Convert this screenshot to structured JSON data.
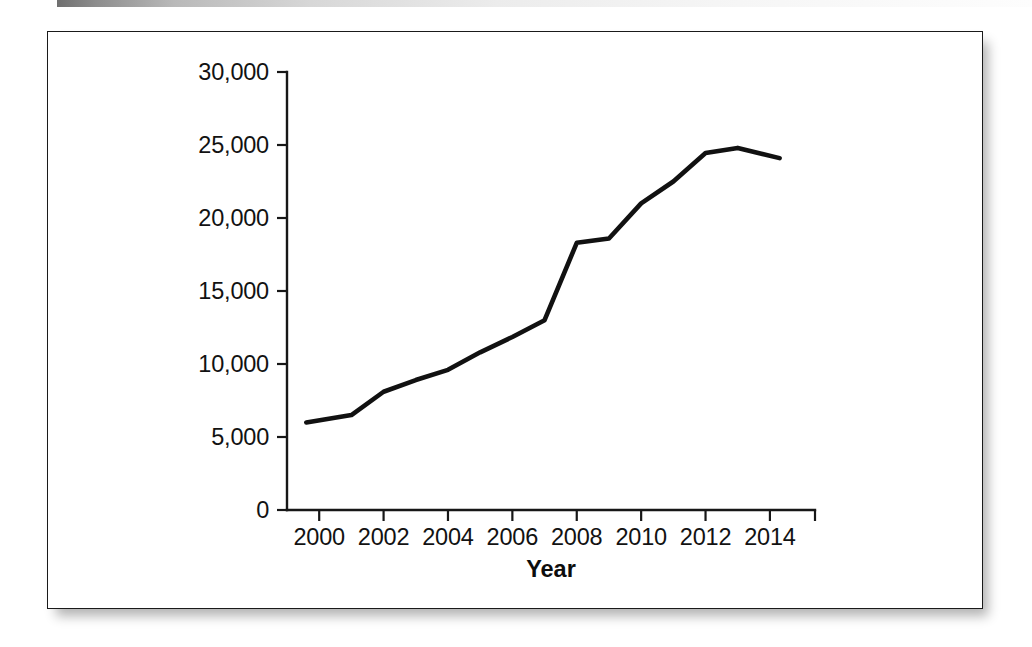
{
  "figure": {
    "panel_name": "line-chart-figure-panel",
    "border_color": "#1a1a1a",
    "background_color": "#ffffff",
    "line_color": "#111111"
  },
  "chart_data": {
    "type": "line",
    "title": "",
    "subtitle": "",
    "xlabel": "Year",
    "ylabel": "",
    "grid": false,
    "legend": "none",
    "xlim": [
      1999,
      2015.4
    ],
    "ylim": [
      0,
      30000
    ],
    "x_tick_labels": [
      "2000",
      "2002",
      "2004",
      "2006",
      "2008",
      "2010",
      "2012",
      "2014"
    ],
    "x_ticks": [
      2000,
      2002,
      2004,
      2006,
      2008,
      2010,
      2012,
      2014
    ],
    "y_tick_labels": [
      "0",
      "5,000",
      "10,000",
      "15,000",
      "20,000",
      "25,000",
      "30,000"
    ],
    "y_ticks": [
      0,
      5000,
      10000,
      15000,
      20000,
      25000,
      30000
    ],
    "series": [
      {
        "name": "series-1",
        "x": [
          1999.6,
          2001,
          2002,
          2003,
          2004,
          2005,
          2006,
          2007,
          2008,
          2009,
          2010,
          2011,
          2012,
          2013,
          2014.3
        ],
        "values": [
          6000,
          6500,
          8100,
          8900,
          9600,
          10800,
          11850,
          13000,
          18300,
          18600,
          21000,
          22500,
          24450,
          24800,
          24100
        ]
      }
    ]
  }
}
